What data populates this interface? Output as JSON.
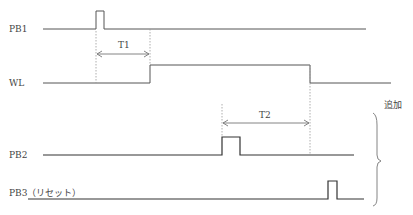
{
  "signals": [
    {
      "id": "pb1",
      "label": "PB1"
    },
    {
      "id": "wl",
      "label": "WL"
    },
    {
      "id": "pb2",
      "label": "PB2"
    },
    {
      "id": "pb3",
      "label": "PB3（リセット）"
    }
  ],
  "intervals": [
    {
      "id": "t1",
      "label": "T1"
    },
    {
      "id": "t2",
      "label": "T2"
    }
  ],
  "annotation": {
    "label": "追加"
  },
  "colors": {
    "signal": "#555555",
    "dashed": "#999999",
    "arrow": "#777777"
  }
}
